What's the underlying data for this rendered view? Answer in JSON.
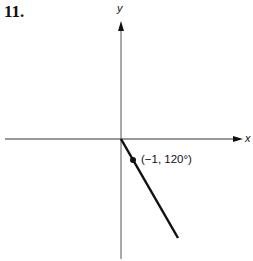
{
  "problem_number": "11.",
  "axes": {
    "x_label": "x",
    "y_label": "y"
  },
  "point": {
    "label": "(−1, 120°)",
    "r": -1,
    "theta_deg": 120
  },
  "colors": {
    "ink": "#111111",
    "axis": "#333333"
  }
}
